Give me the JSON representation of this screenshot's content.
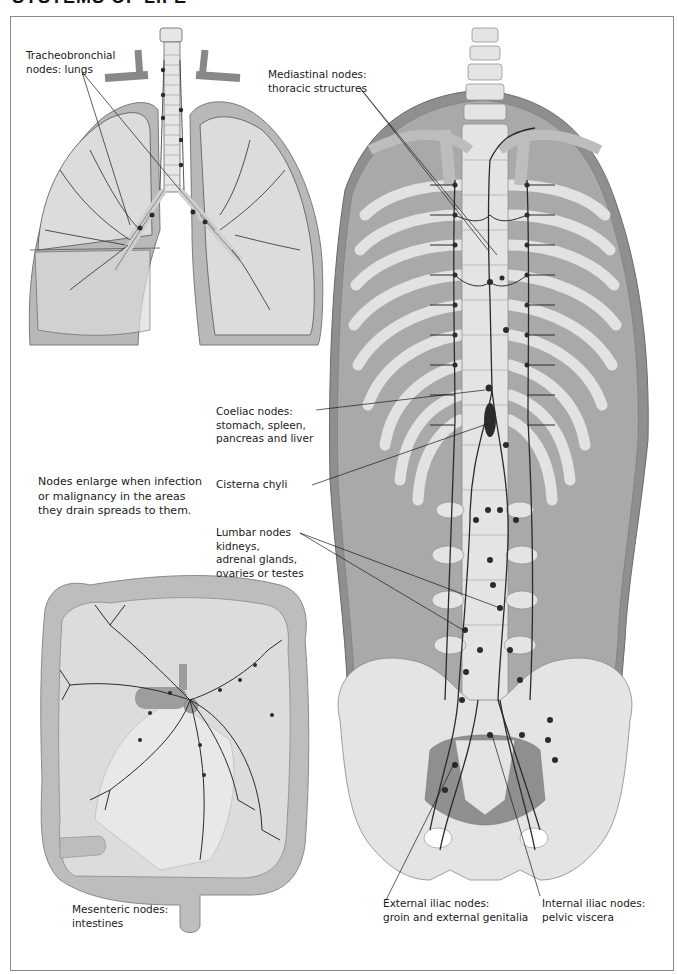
{
  "page": {
    "title_clipped": "SYSTEMS OF LIFE",
    "colors": {
      "background": "#ffffff",
      "frame_border": "#8a8a8a",
      "bone_light": "#e4e4e4",
      "tissue_mid": "#b9b9b9",
      "tissue_dark": "#8f8f8f",
      "lymph_vessel": "#2b2b2b",
      "label_text": "#1a1a1a"
    }
  },
  "diagram": {
    "panels": [
      {
        "id": "lungs",
        "name": "Lungs with tracheobronchial nodes"
      },
      {
        "id": "torso",
        "name": "Trunk with thoracic duct, ribs, spine and pelvis"
      },
      {
        "id": "intestines",
        "name": "Intestines with mesenteric nodes"
      }
    ],
    "labels": {
      "tracheobronchial": {
        "line1": "Tracheobronchial",
        "line2": "nodes: lungs"
      },
      "mediastinal": {
        "line1": "Mediastinal nodes:",
        "line2": "thoracic structures"
      },
      "coeliac": {
        "line1": "Coeliac nodes:",
        "line2": "stomach, spleen,",
        "line3": "pancreas and liver"
      },
      "cisterna": {
        "line1": "Cisterna chyli"
      },
      "lumbar": {
        "line1": "Lumbar nodes",
        "line2": "kidneys,",
        "line3": "adrenal glands,",
        "line4": "ovaries or testes"
      },
      "mesenteric": {
        "line1": "Mesenteric nodes:",
        "line2": "intestines"
      },
      "external_iliac": {
        "line1": "External iliac nodes:",
        "line2": "groin and external genitalia"
      },
      "internal_iliac": {
        "line1": "Internal iliac nodes:",
        "line2": "pelvic viscera"
      }
    },
    "note": {
      "line1": "Nodes enlarge when infection",
      "line2": "or malignancy in the areas",
      "line3": "they drain spreads to them."
    }
  }
}
